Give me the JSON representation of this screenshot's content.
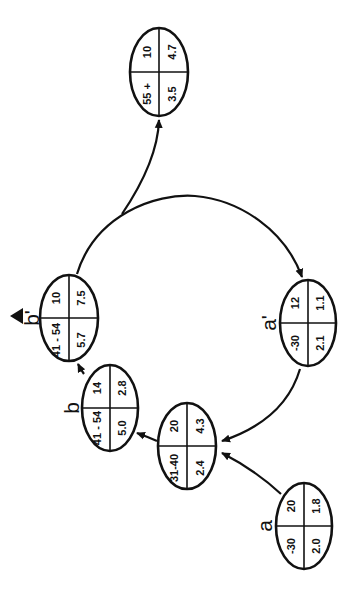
{
  "diagram": {
    "nodes": [
      {
        "id": "n55",
        "label": "",
        "cells": {
          "age": "55 +",
          "count": "10",
          "top_right": "4.7",
          "bottom_right": "3.5"
        }
      },
      {
        "id": "nbp",
        "label": "b'",
        "has_up_arrow": true,
        "cells": {
          "age": "41 - 54",
          "count": "10",
          "top_right": "7.5",
          "bottom_right": "5.7"
        }
      },
      {
        "id": "nap",
        "label": "a'",
        "cells": {
          "age": "-30",
          "count": "12",
          "top_right": "1.1",
          "bottom_right": "2.1"
        }
      },
      {
        "id": "nb",
        "label": "b",
        "cells": {
          "age": "41 - 54",
          "count": "14",
          "top_right": "2.8",
          "bottom_right": "5.0"
        }
      },
      {
        "id": "n31",
        "label": "",
        "cells": {
          "age": "31-40",
          "count": "20",
          "top_right": "4.3",
          "bottom_right": "2.4"
        }
      },
      {
        "id": "na",
        "label": "a",
        "cells": {
          "age": "-30",
          "count": "20",
          "top_right": "1.8",
          "bottom_right": "2.0"
        }
      }
    ],
    "edges": [
      {
        "from": "na",
        "to": "n31"
      },
      {
        "from": "nap",
        "to": "n31"
      },
      {
        "from": "n31",
        "to": "nb"
      },
      {
        "from": "nb",
        "to": "nbp"
      },
      {
        "from": "nbp",
        "to": "nap"
      },
      {
        "from": "nbp",
        "to": "n55"
      }
    ]
  }
}
